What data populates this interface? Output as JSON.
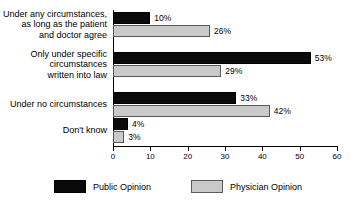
{
  "chart_data": {
    "type": "bar",
    "orientation": "horizontal",
    "title": "",
    "subtitle": "",
    "xlabel": "",
    "ylabel": "",
    "xlim": [
      0,
      60
    ],
    "grid": false,
    "legend_position": "bottom-center",
    "tick_labels": [
      "0",
      "10",
      "20",
      "30",
      "40",
      "50",
      "60"
    ],
    "ticks": [
      0,
      10,
      20,
      30,
      40,
      50,
      60
    ],
    "categories": [
      "Under any circumstances,\nas long as the patient\nand doctor agree",
      "Only under specific\ncircumstances\nwritten into law",
      "Under no circumstances",
      "Don't know"
    ],
    "series": [
      {
        "name": "Public Opinion",
        "color": "#0a0a0a",
        "values": [
          10,
          53,
          33,
          4
        ],
        "labels": [
          "10%",
          "53%",
          "33%",
          "4%"
        ]
      },
      {
        "name": "Physician Opinion",
        "color": "#c9c9c9",
        "values": [
          26,
          29,
          42,
          3
        ],
        "labels": [
          "26%",
          "29%",
          "42%",
          "3%"
        ]
      }
    ]
  },
  "legend": {
    "items": [
      {
        "label": "Public Opinion"
      },
      {
        "label": "Physician Opinion"
      }
    ]
  }
}
